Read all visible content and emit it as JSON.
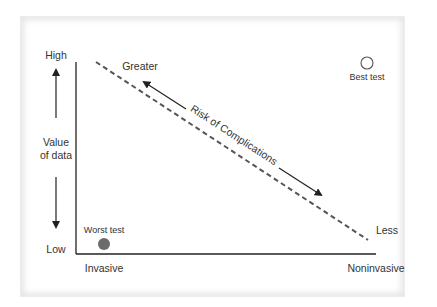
{
  "diagram": {
    "y_axis": {
      "top_label": "High",
      "bottom_label": "Low",
      "title_line1": "Value",
      "title_line2": "of data"
    },
    "x_axis": {
      "left_label": "Invasive",
      "right_label": "Noninvasive"
    },
    "trend": {
      "start_label": "Greater",
      "end_label": "Less",
      "label": "Risk of Complications",
      "style": "dashed"
    },
    "points": [
      {
        "label": "Best test",
        "style": "hollow circle",
        "position": "high value, noninvasive"
      },
      {
        "label": "Worst test",
        "style": "filled gray circle",
        "position": "low value, invasive"
      }
    ],
    "colors": {
      "line": "#222222",
      "dash": "#555555",
      "worst_fill": "#6b6b6b",
      "best_stroke": "#555555",
      "text": "#333333"
    }
  }
}
